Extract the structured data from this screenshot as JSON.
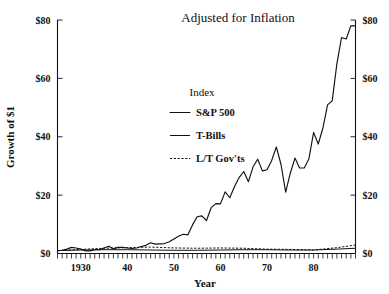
{
  "chart_data": {
    "type": "line",
    "title": "Adjusted for Inflation",
    "xlabel": "Year",
    "ylabel": "Growth of $1",
    "xlim": [
      1925,
      1989
    ],
    "ylim": [
      0,
      80
    ],
    "grid": false,
    "legend_position": "upper-center-left",
    "legend_title": "Index",
    "y_ticks": [
      0,
      20,
      40,
      60,
      80
    ],
    "y_ticklabels": [
      "$0",
      "$20",
      "$40",
      "$60",
      "$80"
    ],
    "y_axis_right_ticklabels": [
      "$0",
      "$20",
      "$40",
      "$60",
      "$80"
    ],
    "x_ticks": [
      1930,
      1940,
      1950,
      1960,
      1970,
      1980
    ],
    "x_ticklabels": [
      "1930",
      "40",
      "50",
      "60",
      "70",
      "80"
    ],
    "x_minor_tick_interval": 1,
    "series": [
      {
        "name": "S&P 500",
        "style": "solid",
        "x": [
          1925,
          1926,
          1927,
          1928,
          1929,
          1930,
          1931,
          1932,
          1933,
          1934,
          1935,
          1936,
          1937,
          1938,
          1939,
          1940,
          1941,
          1942,
          1943,
          1944,
          1945,
          1946,
          1947,
          1948,
          1949,
          1950,
          1951,
          1952,
          1953,
          1954,
          1955,
          1956,
          1957,
          1958,
          1959,
          1960,
          1961,
          1962,
          1963,
          1964,
          1965,
          1966,
          1967,
          1968,
          1969,
          1970,
          1971,
          1972,
          1973,
          1974,
          1975,
          1976,
          1977,
          1978,
          1979,
          1980,
          1981,
          1982,
          1983,
          1984,
          1985,
          1986,
          1987,
          1988,
          1989
        ],
        "values": [
          1.0,
          1.1,
          1.5,
          2.1,
          1.9,
          1.5,
          0.9,
          0.9,
          1.3,
          1.3,
          1.9,
          2.5,
          1.6,
          2.1,
          2.1,
          1.9,
          1.7,
          1.9,
          2.4,
          2.8,
          3.7,
          3.2,
          3.3,
          3.4,
          4.0,
          5.0,
          5.9,
          6.6,
          6.4,
          9.8,
          12.6,
          12.9,
          11.3,
          15.7,
          17.1,
          17.0,
          21.1,
          19.1,
          22.9,
          26.0,
          28.1,
          24.6,
          29.7,
          32.3,
          28.3,
          28.7,
          31.9,
          36.5,
          30.5,
          21.0,
          27.5,
          32.7,
          29.3,
          29.3,
          32.5,
          41.5,
          37.5,
          43.0,
          50.9,
          52.3,
          65.0,
          74.0,
          73.5,
          78.0,
          78.0
        ]
      },
      {
        "name": "T-Bills",
        "style": "solid",
        "x": [
          1925,
          1930,
          1935,
          1940,
          1945,
          1950,
          1955,
          1960,
          1965,
          1970,
          1975,
          1980,
          1985,
          1989
        ],
        "values": [
          1.0,
          1.2,
          1.3,
          1.3,
          1.2,
          1.1,
          1.1,
          1.2,
          1.3,
          1.3,
          1.2,
          1.2,
          1.5,
          1.8
        ]
      },
      {
        "name": "L/T Gov'ts",
        "style": "dashed",
        "x": [
          1925,
          1930,
          1935,
          1940,
          1945,
          1950,
          1955,
          1960,
          1965,
          1970,
          1975,
          1980,
          1985,
          1989
        ],
        "values": [
          1.0,
          1.4,
          1.8,
          2.0,
          2.2,
          1.9,
          1.8,
          1.9,
          1.8,
          1.5,
          1.4,
          1.2,
          2.0,
          2.9
        ]
      }
    ],
    "annotations": []
  },
  "colors": {
    "ink": "#111111",
    "background": "#ffffff"
  }
}
